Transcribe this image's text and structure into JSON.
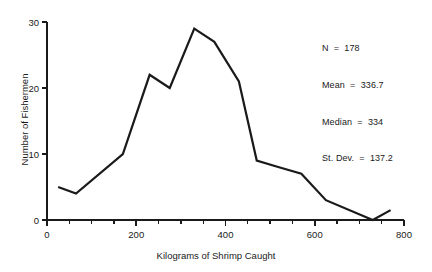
{
  "chart_data": {
    "type": "line",
    "title": "",
    "subtitle": "",
    "xlabel": "Kilograms of Shrimp Caught",
    "ylabel": "Number of Fishermen",
    "xlim": [
      0,
      800
    ],
    "ylim": [
      0,
      30
    ],
    "xticks": [
      0,
      200,
      400,
      600,
      800
    ],
    "yticks": [
      0,
      10,
      20,
      30
    ],
    "xticklabels": [
      "0",
      "200",
      "400",
      "600",
      "800"
    ],
    "yticklabels": [
      "0",
      "10",
      "20",
      "30"
    ],
    "x_minor_tick_step": 50,
    "grid": false,
    "legend": null,
    "line_color": "#1a1a1a",
    "line_width": 2.2,
    "series": [
      {
        "name": "Frequency polygon",
        "x": [
          25,
          65,
          170,
          230,
          275,
          330,
          375,
          430,
          470,
          520,
          570,
          625,
          730,
          770
        ],
        "values": [
          5,
          4,
          10,
          22,
          20,
          29,
          27,
          21,
          9,
          8,
          7,
          3,
          0,
          1.5
        ]
      }
    ],
    "annotations": [
      "N  =  178",
      "Mean  =  336.7",
      "Median  =  334",
      "St. Dev.  =  137.2"
    ]
  },
  "stats": {
    "n": "N  =  178",
    "mean": "Mean  =  336.7",
    "median": "Median  =  334",
    "stdev": "St. Dev.  =  137.2"
  },
  "axes": {
    "xlabel": "Kilograms of Shrimp Caught",
    "ylabel": "Number of Fishermen"
  }
}
